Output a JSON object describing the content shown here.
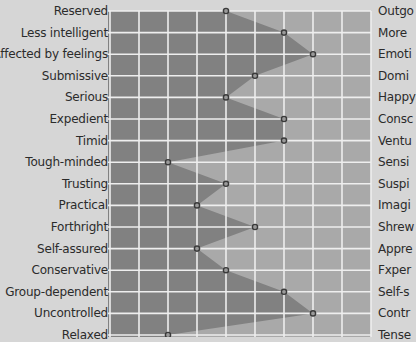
{
  "chart_data": {
    "type": "line",
    "title": "",
    "xlabel": "",
    "ylabel": "",
    "xlim": [
      1,
      10
    ],
    "grid": true,
    "legend": null,
    "left_labels": [
      "Reserved",
      "Less intelligent",
      "Affected by feelings",
      "Submissive",
      "Serious",
      "Expedient",
      "Timid",
      "Tough-minded",
      "Trusting",
      "Practical",
      "Forthright",
      "Self-assured",
      "Conservative",
      "Group-dependent",
      "Uncontrolled",
      "Relaxed"
    ],
    "right_labels": [
      "Outgo",
      "More",
      "Emoti",
      "Domi",
      "Happy",
      "Consc",
      "Ventu",
      "Sensi",
      "Suspi",
      "Imagi",
      "Shrew",
      "Appre",
      "Fxper",
      "Self-s",
      "Contr",
      "Tense"
    ],
    "series": [
      {
        "name": "profile",
        "values": [
          5,
          7,
          8,
          6,
          5,
          7,
          7,
          3,
          5,
          4,
          6,
          4,
          5,
          7,
          8,
          3
        ]
      }
    ]
  },
  "colors": {
    "background": "#d6d6d6",
    "grid_fill_light": "#a9a9a9",
    "profile_fill_dark": "#818181",
    "grid_lines": "#eeeeee",
    "marker": "#3a3a3a",
    "text": "#2b2b2b"
  }
}
